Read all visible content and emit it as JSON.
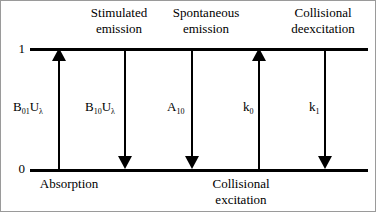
{
  "figure": {
    "levels": [
      {
        "id": "upper",
        "label": "1"
      },
      {
        "id": "lower",
        "label": "0"
      }
    ],
    "transitions": [
      {
        "id": "absorption",
        "top_caption": "",
        "bottom_caption": "Absorption",
        "rate_symbol": "B",
        "rate_subscript": "01",
        "rate_factor": "U",
        "rate_factor_subscript": "λ",
        "direction": "up"
      },
      {
        "id": "stimulated-emission",
        "top_caption": "Stimulated emission",
        "bottom_caption": "",
        "rate_symbol": "B",
        "rate_subscript": "10",
        "rate_factor": "U",
        "rate_factor_subscript": "λ",
        "direction": "down"
      },
      {
        "id": "spontaneous-emission",
        "top_caption": "Spontaneous emission",
        "bottom_caption": "",
        "rate_symbol": "A",
        "rate_subscript": "10",
        "rate_factor": "",
        "rate_factor_subscript": "",
        "direction": "down"
      },
      {
        "id": "collisional-excitation",
        "top_caption": "",
        "bottom_caption": "Collisional excitation",
        "rate_symbol": "k",
        "rate_subscript": "0",
        "rate_factor": "",
        "rate_factor_subscript": "",
        "direction": "up"
      },
      {
        "id": "collisional-deexcitation",
        "top_caption": "Collisional deexcitation",
        "bottom_caption": "",
        "rate_symbol": "k",
        "rate_subscript": "1",
        "rate_factor": "",
        "rate_factor_subscript": "",
        "direction": "down"
      }
    ],
    "captions": {
      "stimulated_emission_line1": "Stimulated",
      "stimulated_emission_line2": "emission",
      "spontaneous_emission_line1": "Spontaneous",
      "spontaneous_emission_line2": "emission",
      "collisional_deexcitation_line1": "Collisional",
      "collisional_deexcitation_line2": "deexcitation",
      "absorption": "Absorption",
      "collisional_excitation_line1": "Collisional",
      "collisional_excitation_line2": "excitation"
    },
    "colors": {
      "ink": "#000000",
      "background": "#ffffff",
      "frame": "#9a9a9a"
    }
  }
}
